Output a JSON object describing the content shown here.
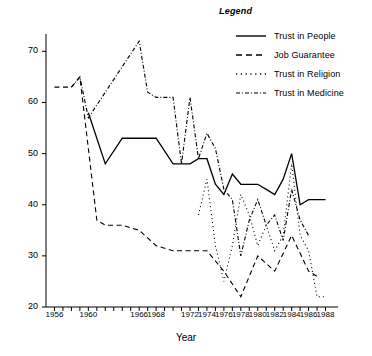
{
  "chart_data": {
    "type": "line",
    "title": "",
    "xlabel": "Year",
    "ylabel": "",
    "xlim": [
      1955,
      1989
    ],
    "ylim": [
      20,
      73
    ],
    "grid": false,
    "legend_title": "Legend",
    "legend_position": "top-right",
    "x_ticks": [
      1956,
      1957,
      1958,
      1959,
      1960,
      1961,
      1962,
      1963,
      1964,
      1965,
      1966,
      1967,
      1968,
      1969,
      1970,
      1971,
      1972,
      1973,
      1974,
      1975,
      1976,
      1977,
      1978,
      1979,
      1980,
      1981,
      1982,
      1983,
      1984,
      1985,
      1986,
      1987,
      1988
    ],
    "x_tick_labels": [
      "1956",
      "1960",
      "1966",
      "1968",
      "1972",
      "1974",
      "1976",
      "1978",
      "1980",
      "1982",
      "1984",
      "1986",
      "1988"
    ],
    "y_ticks": [
      20,
      30,
      40,
      50,
      60,
      70
    ],
    "y_tick_labels": [
      "20",
      "30",
      "40",
      "50",
      "60",
      "70"
    ],
    "series": [
      {
        "name": "Trust in People",
        "style": "solid",
        "x": [
          1960,
          1962,
          1964,
          1966,
          1968,
          1970,
          1972,
          1973,
          1974,
          1975,
          1976,
          1977,
          1978,
          1979,
          1980,
          1981,
          1982,
          1983,
          1984,
          1985,
          1986,
          1987,
          1988
        ],
        "values": [
          58,
          48,
          53,
          53,
          53,
          48,
          48,
          49,
          49,
          44,
          42,
          46,
          44,
          44,
          44,
          43,
          42,
          45,
          50,
          40,
          41,
          41,
          41
        ]
      },
      {
        "name": "Job Guarantee",
        "style": "dashed",
        "x": [
          1956,
          1957,
          1958,
          1959,
          1960,
          1961,
          1962,
          1964,
          1966,
          1968,
          1970,
          1972,
          1974,
          1976,
          1978,
          1980,
          1982,
          1984,
          1986,
          1987
        ],
        "values": [
          63,
          63,
          63,
          65,
          51,
          37,
          36,
          36,
          35,
          32,
          31,
          31,
          31,
          27,
          22,
          30,
          27,
          34,
          27,
          26
        ]
      },
      {
        "name": "Trust in Religion",
        "style": "dotted",
        "x": [
          1973,
          1974,
          1975,
          1976,
          1977,
          1978,
          1979,
          1980,
          1981,
          1982,
          1983,
          1984,
          1985,
          1986,
          1987,
          1988
        ],
        "values": [
          38,
          45,
          32,
          25,
          32,
          42,
          38,
          32,
          36,
          31,
          34,
          48,
          34,
          31,
          22,
          22
        ]
      },
      {
        "name": "Trust in Medicine",
        "style": "dash-dot",
        "x": [
          1958,
          1959,
          1960,
          1966,
          1967,
          1968,
          1970,
          1971,
          1972,
          1973,
          1974,
          1975,
          1976,
          1977,
          1978,
          1979,
          1980,
          1981,
          1982,
          1983,
          1984,
          1985,
          1986
        ],
        "values": [
          63,
          65,
          57,
          72,
          62,
          61,
          61,
          48,
          61,
          49,
          54,
          51,
          43,
          41,
          30,
          37,
          41,
          36,
          38,
          33,
          43,
          37,
          34
        ]
      }
    ]
  }
}
